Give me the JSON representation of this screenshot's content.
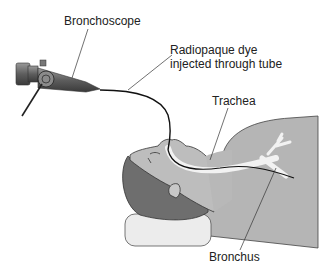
{
  "labels": {
    "bronchoscope": "Bronchoscope",
    "dye_line1": "Radiopaque dye",
    "dye_line2": "injected through tube",
    "trachea": "Trachea",
    "bronchus": "Bronchus"
  },
  "colors": {
    "skin": "#b8b8b8",
    "hair": "#6e6e6e",
    "pillow": "#ececec",
    "airway": "#f2f2f2",
    "scope_body": "#7a7a7a",
    "line": "#222222"
  }
}
